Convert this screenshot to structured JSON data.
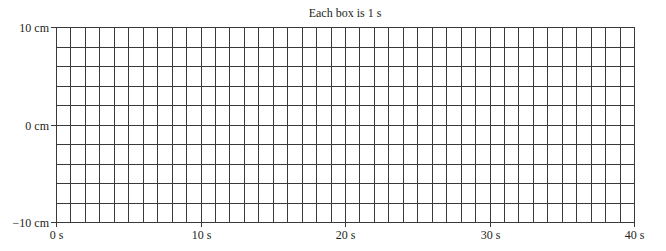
{
  "chart_data": {
    "type": "line",
    "title": "Each box is 1 s",
    "xlabel": "",
    "ylabel": "",
    "x_unit": "s",
    "y_unit": "cm",
    "xlim": [
      0,
      40
    ],
    "ylim": [
      -10,
      10
    ],
    "x_ticks": [
      0,
      10,
      20,
      30,
      40
    ],
    "x_tick_labels": [
      "0 s",
      "10 s",
      "20 s",
      "30 s",
      "40 s"
    ],
    "y_ticks": [
      10,
      0,
      -10
    ],
    "y_tick_labels": [
      "10 cm",
      "0 cm",
      "−10 cm"
    ],
    "grid": true,
    "grid_x_step": 1,
    "grid_y_step": 2,
    "series": [],
    "legend": null
  },
  "colors": {
    "grid": "#3a3a3a",
    "text": "#231f20",
    "background": "#ffffff"
  },
  "layout": {
    "plot_left": 56,
    "plot_right": 634,
    "plot_top": 27,
    "plot_bottom": 222
  }
}
